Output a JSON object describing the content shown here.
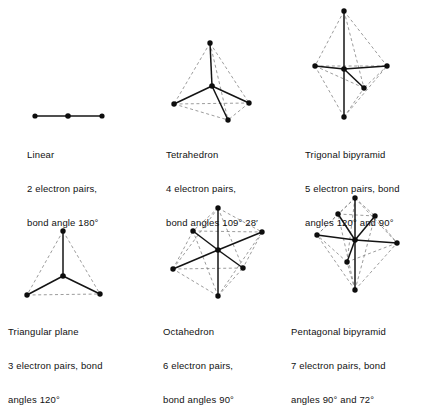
{
  "page": {
    "background_color": "#ffffff",
    "line_color": "#141414",
    "dashed_color": "#8a8a8a",
    "vertex_color": "#0d0d0d"
  },
  "figures": [
    {
      "id": "linear",
      "name": "Linear",
      "caption": {
        "line1": "Linear",
        "line2": "2 electron pairs,",
        "line3": "bond angle 180°"
      },
      "electron_pairs": 2,
      "bond_angles": [
        "180°"
      ],
      "vertices": 3,
      "center": {
        "x": 68,
        "y": 116
      },
      "outer_atoms": [
        {
          "x": 35,
          "y": 116
        },
        {
          "x": 102,
          "y": 116
        }
      ]
    },
    {
      "id": "tetrahedron",
      "name": "Tetrahedron",
      "caption": {
        "line1": "Tetrahedron",
        "line2": "4 electron pairs,",
        "line3": "bond angles 109° 28′"
      },
      "electron_pairs": 4,
      "bond_angles": [
        "109° 28′"
      ],
      "vertices": 5,
      "center": {
        "x": 212,
        "y": 86
      },
      "outer_atoms": [
        {
          "x": 210,
          "y": 43,
          "label": "apex"
        },
        {
          "x": 174,
          "y": 104,
          "label": "base-left"
        },
        {
          "x": 249,
          "y": 103,
          "label": "base-right"
        },
        {
          "x": 228,
          "y": 120,
          "label": "base-front"
        }
      ]
    },
    {
      "id": "trigonal-bipyramid",
      "name": "Trigonal bipyramid",
      "caption": {
        "line1": "Trigonal bipyramid",
        "line2": "5 electron pairs, bond",
        "line3": "angles 120° and 90°"
      },
      "electron_pairs": 5,
      "bond_angles": [
        "120°",
        "90°"
      ],
      "vertices": 6,
      "center": {
        "x": 344,
        "y": 69
      },
      "outer_atoms": [
        {
          "x": 344,
          "y": 11,
          "label": "axial-top"
        },
        {
          "x": 344,
          "y": 117,
          "label": "axial-bottom"
        },
        {
          "x": 315,
          "y": 66,
          "label": "equatorial-left"
        },
        {
          "x": 387,
          "y": 66,
          "label": "equatorial-right"
        },
        {
          "x": 364,
          "y": 88,
          "label": "equatorial-front"
        }
      ]
    },
    {
      "id": "triangular-plane",
      "name": "Triangular plane",
      "caption": {
        "line1": "Triangular plane",
        "line2": "3 electron pairs, bond",
        "line3": "angles 120°"
      },
      "electron_pairs": 3,
      "bond_angles": [
        "120°"
      ],
      "vertices": 4,
      "center": {
        "x": 63,
        "y": 276
      },
      "outer_atoms": [
        {
          "x": 63,
          "y": 231,
          "label": "top"
        },
        {
          "x": 27,
          "y": 295,
          "label": "bottom-left"
        },
        {
          "x": 100,
          "y": 294,
          "label": "bottom-right"
        }
      ]
    },
    {
      "id": "octahedron",
      "name": "Octahedron",
      "caption": {
        "line1": "Octahedron",
        "line2": "6 electron pairs,",
        "line3": "bond angles 90°"
      },
      "electron_pairs": 6,
      "bond_angles": [
        "90°"
      ],
      "vertices": 7,
      "center": {
        "x": 218,
        "y": 250
      },
      "outer_atoms": [
        {
          "x": 218,
          "y": 208,
          "label": "axial-top"
        },
        {
          "x": 218,
          "y": 296,
          "label": "axial-bottom"
        },
        {
          "x": 193,
          "y": 231,
          "label": "equatorial-back-left"
        },
        {
          "x": 262,
          "y": 232,
          "label": "equatorial-back-right"
        },
        {
          "x": 173,
          "y": 269,
          "label": "equatorial-front-left"
        },
        {
          "x": 243,
          "y": 268,
          "label": "equatorial-front-right"
        }
      ]
    },
    {
      "id": "pentagonal-bipyramid",
      "name": "Pentagonal bipyramid",
      "caption": {
        "line1": "Pentagonal bipyramid",
        "line2": "7 electron pairs, bond",
        "line3": "angles 90° and 72°"
      },
      "electron_pairs": 7,
      "bond_angles": [
        "90°",
        "72°"
      ],
      "vertices": 8,
      "center": {
        "x": 355,
        "y": 240
      },
      "outer_atoms": [
        {
          "x": 355,
          "y": 198,
          "label": "axial-top"
        },
        {
          "x": 355,
          "y": 290,
          "label": "axial-bottom"
        },
        {
          "x": 338,
          "y": 214,
          "label": "equatorial-back-left"
        },
        {
          "x": 375,
          "y": 216,
          "label": "equatorial-back-right"
        },
        {
          "x": 317,
          "y": 235,
          "label": "equatorial-left"
        },
        {
          "x": 397,
          "y": 243,
          "label": "equatorial-right"
        },
        {
          "x": 347,
          "y": 262,
          "label": "equatorial-front"
        }
      ]
    }
  ]
}
